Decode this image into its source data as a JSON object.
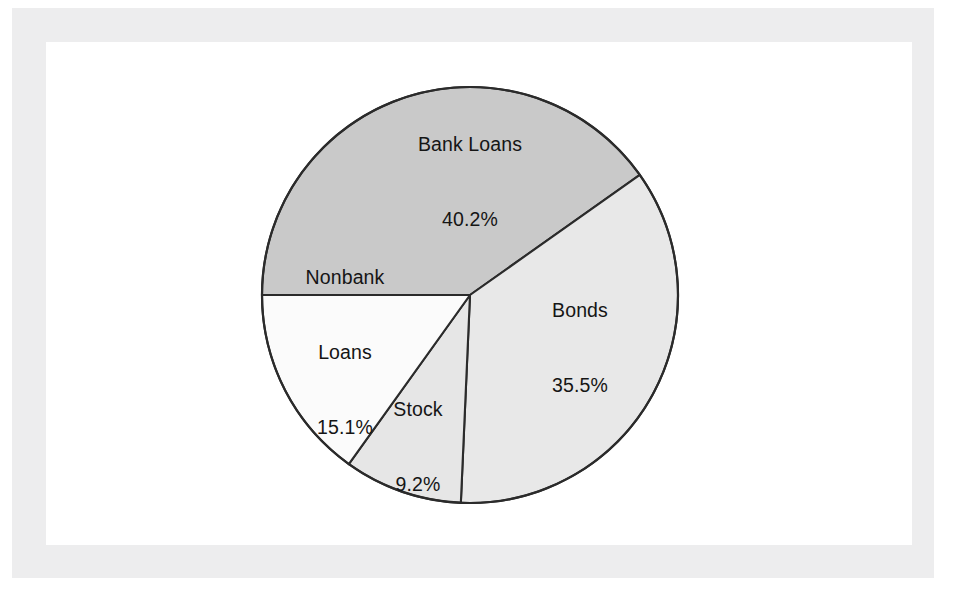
{
  "figure": {
    "background_color": "#ffffff",
    "frame_color": "#ededee",
    "plate_color": "#ffffff",
    "outline_color": "#2b2b2b"
  },
  "chart_data": {
    "type": "pie",
    "title": "",
    "subtitle": "",
    "xlabel": "",
    "ylabel": "",
    "legend_position": "none",
    "grid": false,
    "units": "percent",
    "total": 100.0,
    "labels_inside_slices": true,
    "start_angle_deg": 180,
    "direction": "clockwise",
    "categories": [
      "Bank Loans",
      "Bonds",
      "Stock",
      "Nonbank Loans"
    ],
    "values": [
      40.2,
      35.5,
      9.2,
      15.1
    ],
    "slices": [
      {
        "name": "Bank Loans",
        "value": 40.2,
        "value_label": "40.2%",
        "color": "#c9c9c9",
        "angle_deg": 144.7,
        "label_lines": [
          "Bank Loans",
          "40.2%"
        ]
      },
      {
        "name": "Bonds",
        "value": 35.5,
        "value_label": "35.5%",
        "color": "#e8e8e8",
        "angle_deg": 127.8,
        "label_lines": [
          "Bonds",
          "35.5%"
        ]
      },
      {
        "name": "Stock",
        "value": 9.2,
        "value_label": "9.2%",
        "color": "#e6e6e6",
        "angle_deg": 33.1,
        "label_lines": [
          "Stock",
          "9.2%"
        ]
      },
      {
        "name": "Nonbank Loans",
        "value": 15.1,
        "value_label": "15.1%",
        "color": "#fbfbfb",
        "angle_deg": 54.4,
        "label_lines": [
          "Nonbank",
          "Loans",
          "15.1%"
        ]
      }
    ]
  },
  "labels": {
    "bank_loans": {
      "line1": "Bank Loans",
      "line2": "40.2%"
    },
    "bonds": {
      "line1": "Bonds",
      "line2": "35.5%"
    },
    "stock": {
      "line1": "Stock",
      "line2": "9.2%"
    },
    "nonbank_loans": {
      "line1": "Nonbank",
      "line2": "Loans",
      "line3": "15.1%"
    }
  }
}
